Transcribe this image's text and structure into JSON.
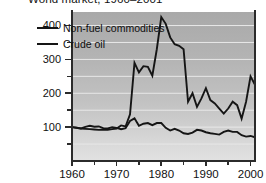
{
  "chart_data": {
    "type": "line",
    "title": "World market, 1960–2001",
    "xlabel": "",
    "ylabel": "",
    "xlim": [
      1960,
      2001
    ],
    "ylim": [
      0,
      440
    ],
    "yticks": [
      100,
      200,
      300,
      400
    ],
    "ytick_labels": [
      "100",
      "200",
      "300",
      "400"
    ],
    "yticks_minor": [
      50,
      150,
      250,
      350
    ],
    "xticks": [
      1960,
      1970,
      1980,
      1990,
      2000
    ],
    "xtick_labels": [
      "1960",
      "1970",
      "1980",
      "1990",
      "2000"
    ],
    "xticks_minor": [
      1965,
      1975,
      1985,
      1995
    ],
    "grid": true,
    "grid_orientation": "horizontal",
    "legend_position": "upper-left-inside",
    "plot_background": "#b8b8b8",
    "series": [
      {
        "name": "Non-fuel commodities",
        "color": "#151515",
        "x": [
          1960,
          1961,
          1962,
          1963,
          1964,
          1965,
          1966,
          1967,
          1968,
          1969,
          1970,
          1971,
          1972,
          1973,
          1974,
          1975,
          1976,
          1977,
          1978,
          1979,
          1980,
          1981,
          1982,
          1983,
          1984,
          1985,
          1986,
          1987,
          1988,
          1989,
          1990,
          1991,
          1992,
          1993,
          1994,
          1995,
          1996,
          1997,
          1998,
          1999,
          2000,
          2001
        ],
        "values": [
          100,
          98,
          96,
          101,
          104,
          101,
          102,
          97,
          96,
          100,
          98,
          94,
          97,
          118,
          126,
          104,
          110,
          112,
          106,
          112,
          112,
          98,
          90,
          95,
          90,
          82,
          80,
          84,
          92,
          90,
          85,
          82,
          80,
          78,
          86,
          90,
          86,
          86,
          76,
          72,
          74,
          70
        ]
      },
      {
        "name": "Crude oil",
        "color": "#151515",
        "x": [
          1960,
          1961,
          1962,
          1963,
          1964,
          1965,
          1966,
          1967,
          1968,
          1969,
          1970,
          1971,
          1972,
          1973,
          1974,
          1975,
          1976,
          1977,
          1978,
          1979,
          1980,
          1981,
          1982,
          1983,
          1984,
          1985,
          1986,
          1987,
          1988,
          1989,
          1990,
          1991,
          1992,
          1993,
          1994,
          1995,
          1996,
          1997,
          1998,
          1999,
          2000,
          2001
        ],
        "values": [
          100,
          98,
          96,
          95,
          94,
          93,
          92,
          93,
          92,
          94,
          96,
          105,
          102,
          138,
          290,
          262,
          280,
          278,
          252,
          330,
          425,
          405,
          365,
          345,
          340,
          330,
          175,
          200,
          160,
          185,
          215,
          180,
          170,
          155,
          140,
          155,
          175,
          165,
          125,
          175,
          250,
          225
        ]
      }
    ]
  }
}
